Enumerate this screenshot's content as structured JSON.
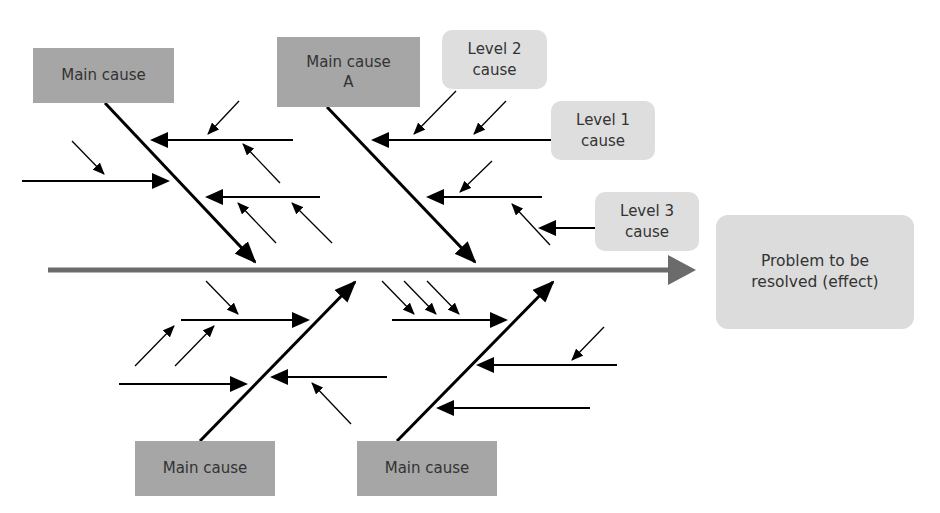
{
  "diagram": {
    "type": "fishbone (Ishikawa) cause-and-effect diagram",
    "colors": {
      "main_cause_fill": "#a6a6a6",
      "level_cause_fill": "#dedede",
      "effect_fill": "#dcdcdc",
      "spine": "#6b6b6b",
      "bones": "#000000",
      "text": "#333333"
    },
    "effect": {
      "label": "Problem to be\nresolved (effect)"
    },
    "main_causes": [
      {
        "id": "top-left",
        "label": "Main cause"
      },
      {
        "id": "top-a",
        "label": "Main cause\nA"
      },
      {
        "id": "bottom-left",
        "label": "Main cause"
      },
      {
        "id": "bottom-right",
        "label": "Main cause"
      }
    ],
    "level_labels": [
      {
        "id": "level-2",
        "label": "Level 2\ncause"
      },
      {
        "id": "level-1",
        "label": "Level 1\ncause"
      },
      {
        "id": "level-3",
        "label": "Level 3\ncause"
      }
    ]
  }
}
